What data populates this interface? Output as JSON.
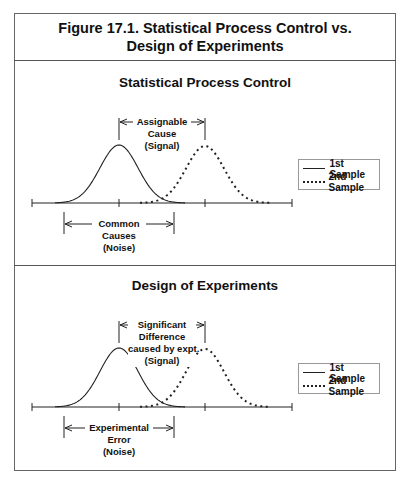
{
  "figure": {
    "title_line1": "Figure 17.1.  Statistical Process Control vs.",
    "title_line2": "Design of Experiments"
  },
  "panels": [
    {
      "title": "Statistical Process Control",
      "signal_label": [
        "Assignable",
        "Cause",
        "(Signal)"
      ],
      "noise_label": [
        "Common",
        "Causes",
        "(Noise)"
      ],
      "legend": [
        {
          "label": "1st Sample",
          "style": "solid"
        },
        {
          "label": "2nd Sample",
          "style": "dotted"
        }
      ]
    },
    {
      "title": "Design of Experiments",
      "signal_label": [
        "Significant",
        "Difference",
        "caused by expt.",
        "(Signal)"
      ],
      "noise_label": [
        "Experimental",
        "Error",
        "(Noise)"
      ],
      "legend": [
        {
          "label": "1st Sample",
          "style": "solid"
        },
        {
          "label": "2nd Sample",
          "style": "dotted"
        }
      ]
    }
  ],
  "colors": {
    "line": "#222222",
    "frame": "#666666",
    "background": "#ffffff"
  }
}
